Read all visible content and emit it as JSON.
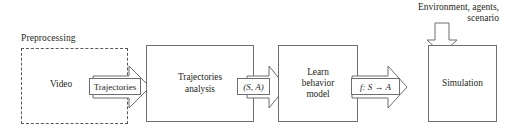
{
  "diagram": {
    "type": "flowchart",
    "title_caption": "Preprocessing",
    "group": {
      "label": "Preprocessing",
      "style": "dashed"
    },
    "nodes": [
      {
        "id": "video",
        "label": "Video",
        "lines": [
          "Video"
        ]
      },
      {
        "id": "analysis",
        "label": "Trajectories analysis",
        "lines": [
          "Trajectories",
          "analysis"
        ]
      },
      {
        "id": "learn",
        "label": "Learn behavior model",
        "lines": [
          "Learn",
          "behavior",
          "model"
        ]
      },
      {
        "id": "simulation",
        "label": "Simulation",
        "lines": [
          "Simulation"
        ]
      }
    ],
    "edges": [
      {
        "id": "e1",
        "from": "video",
        "to": "analysis",
        "label": "Trajectories",
        "italic": false,
        "direction": "right"
      },
      {
        "id": "e2",
        "from": "analysis",
        "to": "learn",
        "label": "(S, A)",
        "italic": true,
        "direction": "right"
      },
      {
        "id": "e3",
        "from": "learn",
        "to": "simulation",
        "label": "f: S → A",
        "italic": true,
        "direction": "right"
      },
      {
        "id": "e4",
        "from": "external",
        "to": "simulation",
        "label": "",
        "italic": false,
        "direction": "down"
      }
    ],
    "annotations": [
      {
        "id": "env",
        "lines": [
          "Environment, agents,",
          "scenario"
        ],
        "attached_to": "simulation"
      }
    ],
    "colors": {
      "stroke": "#6d6e71",
      "dashed_stroke": "#58585a",
      "text": "#231f20",
      "background": "#ffffff"
    }
  }
}
